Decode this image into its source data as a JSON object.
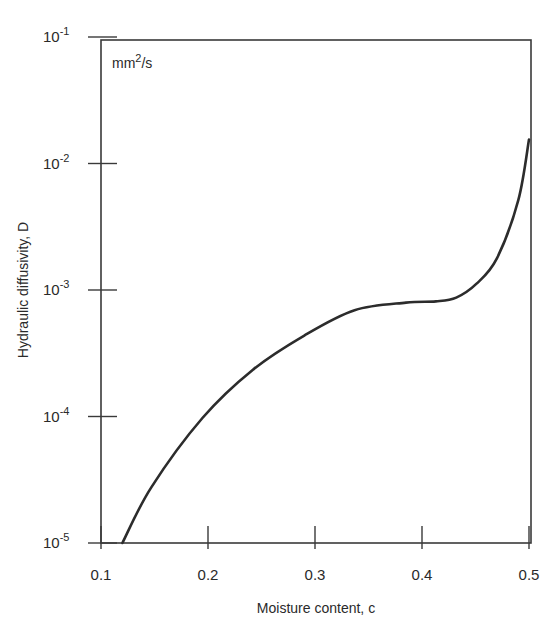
{
  "chart_data": {
    "type": "line",
    "title": "",
    "xlabel": "Moisture content, c",
    "ylabel": "Hydraulic diffusivity, D",
    "unit_annotation": "mm2/s",
    "xlim": [
      0.1,
      0.5
    ],
    "ylim": [
      1e-05,
      0.1
    ],
    "yscale": "log",
    "grid": false,
    "legend": null,
    "x_ticks": [
      "0.1",
      "0.2",
      "0.3",
      "0.4",
      "0.5"
    ],
    "y_ticks": [
      {
        "base": "10",
        "exp": "-1"
      },
      {
        "base": "10",
        "exp": "-2"
      },
      {
        "base": "10",
        "exp": "-3"
      },
      {
        "base": "10",
        "exp": "-4"
      },
      {
        "base": "10",
        "exp": "-5"
      }
    ],
    "series": [
      {
        "name": "D(c)",
        "x": [
          0.12,
          0.147,
          0.195,
          0.242,
          0.29,
          0.337,
          0.385,
          0.413,
          0.432,
          0.451,
          0.47,
          0.49,
          0.5
        ],
        "log10_y": [
          -5.0,
          -4.56,
          -4.01,
          -3.63,
          -3.36,
          -3.16,
          -3.1,
          -3.09,
          -3.06,
          -2.95,
          -2.75,
          -2.29,
          -1.81
        ]
      }
    ]
  }
}
